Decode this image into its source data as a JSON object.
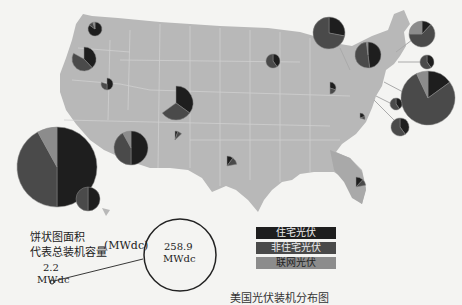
{
  "chart_data": {
    "type": "pie-map",
    "title": "美国光伏装机分布图",
    "size_legend": {
      "label_line1": "饼状图面积",
      "label_line2": "代表总装机容量",
      "unit": "(MWdc)",
      "min_value": "2.2",
      "min_unit": "MWdc",
      "max_value": "258.9",
      "max_unit": "MWdc"
    },
    "legend": [
      {
        "name": "住宅光伏",
        "color": "#1e1e1e"
      },
      {
        "name": "非住宅光伏",
        "color": "#4a4a4a"
      },
      {
        "name": "联网光伏",
        "color": "#8c8c8c"
      }
    ],
    "pies": [
      {
        "region": "California",
        "cx": 57,
        "cy": 167,
        "r": 40,
        "slices": [
          0.5,
          0.42,
          0.08
        ]
      },
      {
        "region": "Washington",
        "cx": 95,
        "cy": 29,
        "r": 7,
        "slices": [
          0.85,
          0.1,
          0.05
        ]
      },
      {
        "region": "Oregon",
        "cx": 84,
        "cy": 59,
        "r": 12,
        "slices": [
          0.38,
          0.45,
          0.0
        ]
      },
      {
        "region": "Nevada",
        "cx": 107,
        "cy": 84,
        "r": 6,
        "slices": [
          0.5,
          0.3,
          0.0
        ]
      },
      {
        "region": "Arizona",
        "cx": 131,
        "cy": 148,
        "r": 17,
        "slices": [
          0.5,
          0.42,
          0.08
        ]
      },
      {
        "region": "Hawaii",
        "cx": 88,
        "cy": 199,
        "r": 12,
        "slices": [
          0.5,
          0.5,
          0.0
        ]
      },
      {
        "region": "Colorado",
        "cx": 176,
        "cy": 103,
        "r": 17,
        "slices": [
          0.35,
          0.3,
          0.0
        ]
      },
      {
        "region": "New Mexico",
        "cx": 175,
        "cy": 140,
        "r": 9,
        "slices": [
          0.05,
          0.08,
          0.0
        ]
      },
      {
        "region": "Texas",
        "cx": 227,
        "cy": 166,
        "r": 10,
        "slices": [
          0.1,
          0.12,
          0.0
        ]
      },
      {
        "region": "Wisconsin",
        "cx": 273,
        "cy": 61,
        "r": 7,
        "slices": [
          0.4,
          0.6,
          0.0
        ]
      },
      {
        "region": "Michigan",
        "cx": 329,
        "cy": 33,
        "r": 16,
        "slices": [
          0.28,
          0.72,
          0.0
        ]
      },
      {
        "region": "Ohio",
        "cx": 330,
        "cy": 88,
        "r": 6,
        "slices": [
          0.3,
          0.2,
          0.0
        ]
      },
      {
        "region": "North Carolina",
        "cx": 360,
        "cy": 118,
        "r": 5,
        "slices": [
          0.2,
          0.1,
          0.0
        ]
      },
      {
        "region": "New York",
        "cx": 368,
        "cy": 55,
        "r": 13,
        "slices": [
          0.48,
          0.5,
          0.02
        ]
      },
      {
        "region": "Massachusetts",
        "cx": 422,
        "cy": 34,
        "r": 13,
        "slices": [
          0.12,
          0.63,
          0.25
        ]
      },
      {
        "region": "Connecticut",
        "cx": 427,
        "cy": 62,
        "r": 7,
        "slices": [
          0.4,
          0.6,
          0.0
        ]
      },
      {
        "region": "New Jersey",
        "cx": 428,
        "cy": 98,
        "r": 27,
        "slices": [
          0.15,
          0.78,
          0.07
        ]
      },
      {
        "region": "Maryland",
        "cx": 396,
        "cy": 104,
        "r": 6,
        "slices": [
          0.4,
          0.6,
          0.0
        ]
      },
      {
        "region": "Delaware/DC",
        "cx": 400,
        "cy": 127,
        "r": 9,
        "slices": [
          0.4,
          0.6,
          0.0
        ]
      },
      {
        "region": "Florida",
        "cx": 356,
        "cy": 187,
        "r": 10,
        "slices": [
          0.12,
          0.1,
          0.0
        ]
      }
    ]
  }
}
